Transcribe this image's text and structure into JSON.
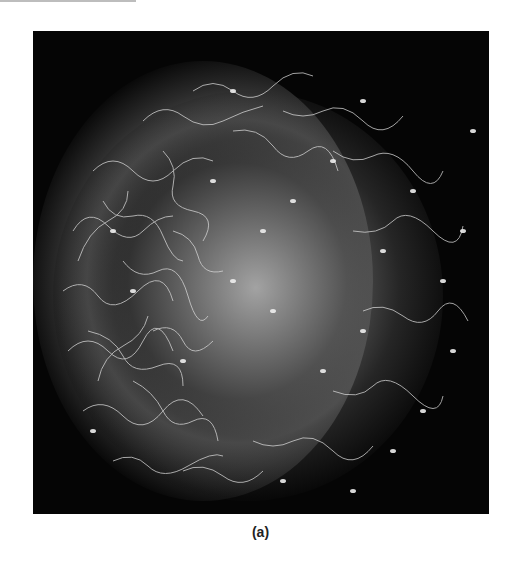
{
  "figure": {
    "caption": "(a)",
    "image_description": "Micrograph of many sperm cells surrounding an egg",
    "colors": {
      "background": "#ffffff",
      "photo_background": "#050505",
      "caption_text": "#222222"
    }
  }
}
